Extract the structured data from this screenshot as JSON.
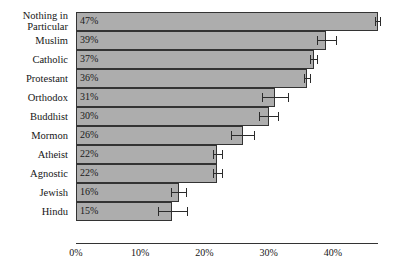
{
  "chart_data": {
    "type": "bar",
    "orientation": "horizontal",
    "title": "",
    "subtitle": "",
    "xlabel": "",
    "ylabel": "",
    "xlim": [
      0,
      47
    ],
    "grid": false,
    "legend": null,
    "value_label_format": "percent",
    "xticks": [
      0,
      10,
      20,
      30,
      40
    ],
    "xtick_labels": [
      "0%",
      "10%",
      "20%",
      "30%",
      "40%"
    ],
    "categories": [
      "Nothing in Particular",
      "Muslim",
      "Catholic",
      "Protestant",
      "Orthodox",
      "Buddhist",
      "Mormon",
      "Atheist",
      "Agnostic",
      "Jewish",
      "Hindu"
    ],
    "values": [
      47,
      39,
      37,
      36,
      31,
      30,
      26,
      22,
      22,
      16,
      15
    ],
    "data_labels": [
      "47%",
      "39%",
      "37%",
      "36%",
      "31%",
      "30%",
      "26%",
      "22%",
      "22%",
      "16%",
      "15%"
    ],
    "error_low": [
      0.4,
      1.5,
      0.6,
      0.5,
      2.0,
      1.5,
      1.8,
      0.7,
      0.7,
      1.2,
      2.3
    ],
    "error_high": [
      0.4,
      1.5,
      0.6,
      0.5,
      2.0,
      1.5,
      1.8,
      0.7,
      0.7,
      1.2,
      2.3
    ],
    "colors": {
      "bar_fill": "#adadad",
      "bar_stroke": "#333333",
      "error_bar": "#2b2b2b",
      "text": "#161616",
      "background": "#ffffff"
    }
  }
}
